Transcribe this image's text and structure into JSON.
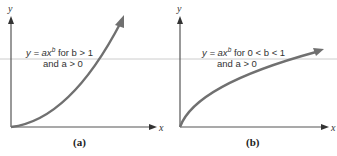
{
  "panels": [
    {
      "id": "a",
      "caption": "(a)",
      "x_axis_label": "x",
      "y_axis_label": "y",
      "equation_line1_prefix": "y = ax",
      "equation_line1_exp": "b",
      "equation_line1_suffix": " for b > 1",
      "equation_line2": "and a > 0",
      "curve": "convex increasing (b > 1)"
    },
    {
      "id": "b",
      "caption": "(b)",
      "x_axis_label": "x",
      "y_axis_label": "y",
      "equation_line1_prefix": "y = ax",
      "equation_line1_exp": "b",
      "equation_line1_suffix": " for 0 < b < 1",
      "equation_line2": "and a > 0",
      "curve": "concave increasing (0 < b < 1)"
    }
  ],
  "colors": {
    "curve": "#6e6e6e",
    "axis": "#555555",
    "guide_line": "#c8c8c8"
  }
}
